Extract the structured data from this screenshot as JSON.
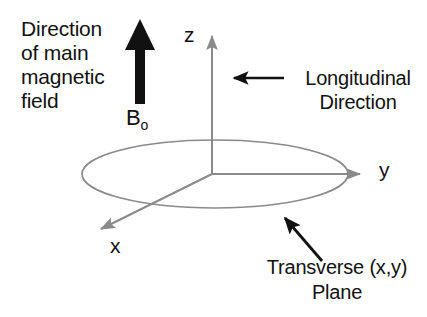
{
  "figure": {
    "background_color": "#ffffff",
    "axis_color": "#8a8a8a",
    "annotation_color": "#111111"
  },
  "labels": {
    "main_field_caption": "Direction\nof main\nmagnetic\nfield",
    "b0_symbol": "B",
    "b0_subscript": "o",
    "axis_z": "z",
    "axis_y": "y",
    "axis_x": "x",
    "longitudinal_caption": "Longitudinal\nDirection",
    "transverse_caption": "Transverse (x,y)\nPlane"
  },
  "geometry": {
    "origin": {
      "x": 212,
      "y": 174
    },
    "z_axis_tip": {
      "x": 212,
      "y": 31
    },
    "y_axis_tip": {
      "x": 366,
      "y": 174
    },
    "x_axis_tip": {
      "x": 94,
      "y": 233
    },
    "ellipse": {
      "cx": 215,
      "cy": 174,
      "rx": 133,
      "ry": 34
    },
    "b0_arrow": {
      "x": 140,
      "y_top": 19,
      "y_bottom": 104
    },
    "longitudinal_arrow": {
      "x_from": 284,
      "x_to": 226,
      "y": 78
    },
    "transverse_arrow": {
      "x_from": 322,
      "y_from": 261,
      "x_to": 279,
      "y_to": 211
    }
  }
}
